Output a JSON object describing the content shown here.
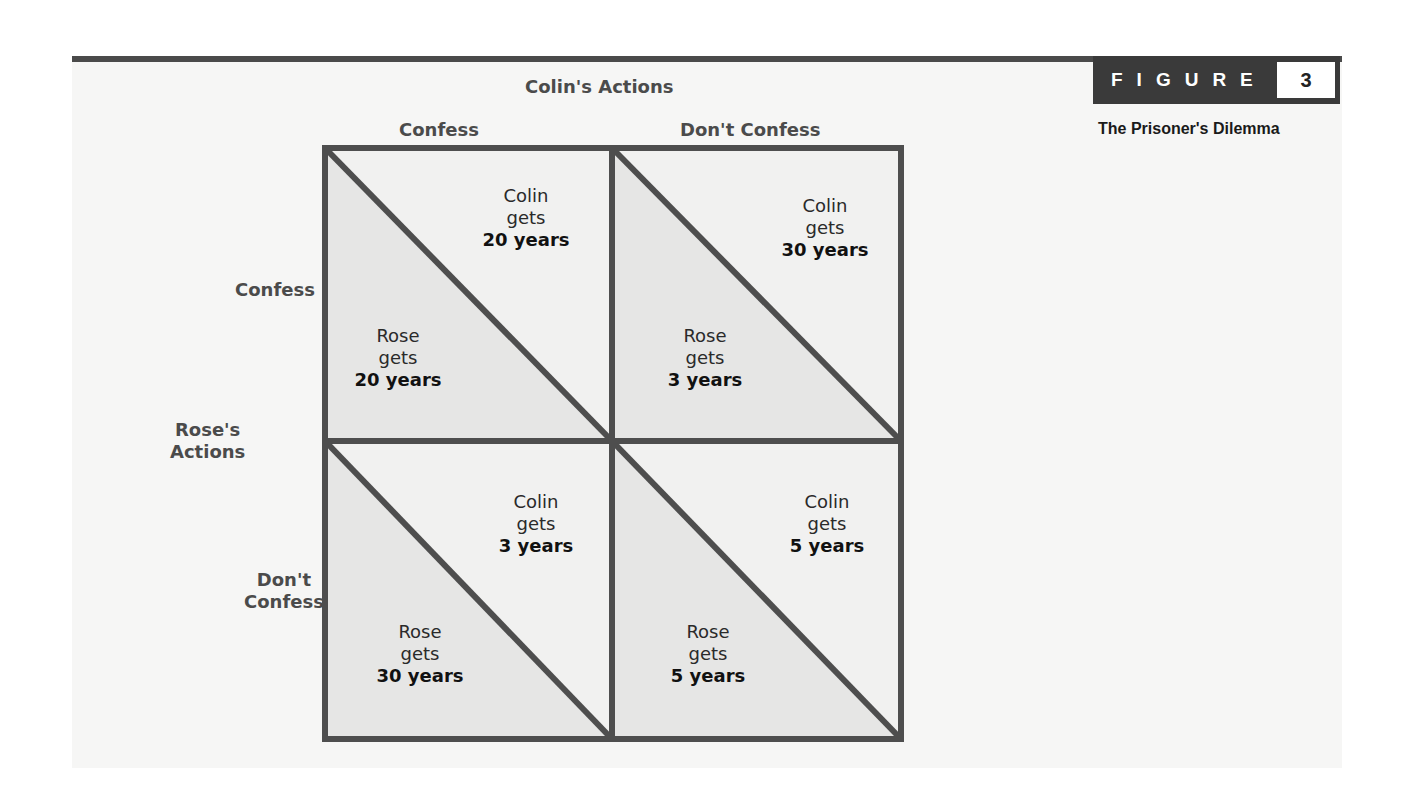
{
  "figure": {
    "label": "FIGURE",
    "number": "3",
    "title": "The Prisoner's Dilemma"
  },
  "column_player": {
    "title": "Colin's Actions",
    "actions": [
      "Confess",
      "Don't Confess"
    ]
  },
  "row_player": {
    "title_line1": "Rose's",
    "title_line2": "Actions",
    "actions": [
      {
        "line1": "Confess",
        "line2": ""
      },
      {
        "line1": "Don't",
        "line2": "Confess"
      }
    ]
  },
  "verb": "gets",
  "colors": {
    "line": "#4e4e4e",
    "lower_triangle": "#e6e6e5",
    "upper_triangle": "#f1f1f0",
    "badge": "#3a3a3a"
  },
  "cells": [
    {
      "row": "Confess",
      "col": "Confess",
      "colin": {
        "name": "Colin",
        "years": "20 years"
      },
      "rose": {
        "name": "Rose",
        "years": "20 years"
      }
    },
    {
      "row": "Confess",
      "col": "Don't Confess",
      "colin": {
        "name": "Colin",
        "years": "30 years"
      },
      "rose": {
        "name": "Rose",
        "years": "3 years"
      }
    },
    {
      "row": "Don't Confess",
      "col": "Confess",
      "colin": {
        "name": "Colin",
        "years": "3 years"
      },
      "rose": {
        "name": "Rose",
        "years": "30 years"
      }
    },
    {
      "row": "Don't Confess",
      "col": "Don't Confess",
      "colin": {
        "name": "Colin",
        "years": "5 years"
      },
      "rose": {
        "name": "Rose",
        "years": "5 years"
      }
    }
  ]
}
